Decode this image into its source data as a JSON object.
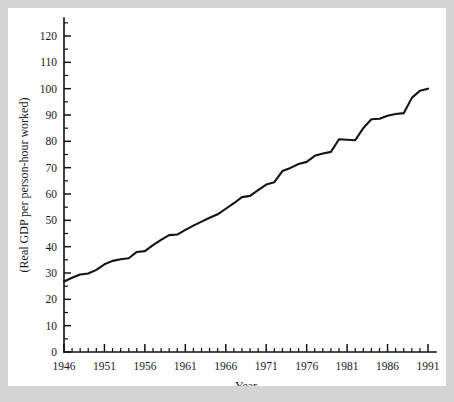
{
  "figure": {
    "background_color": "#d4d4d4",
    "panel_color": "#ffffff",
    "line_color": "#131313"
  },
  "chart_data": {
    "type": "line",
    "title": "",
    "xlabel": "Year",
    "ylabel": "(Real GDP per person-hour worked)",
    "xlim": [
      1946,
      1991
    ],
    "ylim": [
      0,
      127
    ],
    "grid": false,
    "legend": false,
    "y_ticks_major": [
      0,
      10,
      20,
      30,
      40,
      50,
      60,
      70,
      80,
      90,
      100,
      110,
      120
    ],
    "y_ticks_minor": [
      5,
      15,
      25,
      35,
      45,
      55,
      65,
      75,
      85,
      95,
      105,
      115,
      125
    ],
    "x_ticks_major": [
      1946,
      1951,
      1956,
      1961,
      1966,
      1971,
      1976,
      1981,
      1986,
      1991
    ],
    "x_tick_labels": [
      "1946",
      "1951",
      "1956",
      "1961",
      "1966",
      "1971",
      "1976",
      "1981",
      "1986",
      "1991"
    ],
    "x_minor_step": 1,
    "x": [
      1946,
      1947,
      1948,
      1949,
      1950,
      1951,
      1952,
      1953,
      1954,
      1955,
      1956,
      1957,
      1958,
      1959,
      1960,
      1961,
      1962,
      1963,
      1964,
      1965,
      1966,
      1967,
      1968,
      1969,
      1970,
      1971,
      1972,
      1973,
      1974,
      1975,
      1976,
      1977,
      1978,
      1979,
      1980,
      1981,
      1982,
      1983,
      1984,
      1985,
      1986,
      1987,
      1988,
      1989,
      1990,
      1991
    ],
    "values": [
      26.8,
      28.2,
      29.4,
      29.8,
      31.2,
      33.3,
      34.6,
      35.2,
      35.6,
      38.0,
      38.3,
      40.6,
      42.6,
      44.4,
      44.6,
      46.4,
      48.0,
      49.5,
      51.0,
      52.3,
      54.4,
      56.5,
      58.8,
      59.3,
      61.5,
      63.6,
      64.5,
      68.7,
      69.9,
      71.4,
      72.2,
      74.5,
      75.4,
      76.0,
      80.8,
      80.6,
      80.4,
      85.0,
      88.4,
      88.6,
      89.7,
      90.4,
      90.7,
      96.5,
      99.2,
      100.0
    ],
    "series_name": "Real GDP per person-hour worked"
  }
}
